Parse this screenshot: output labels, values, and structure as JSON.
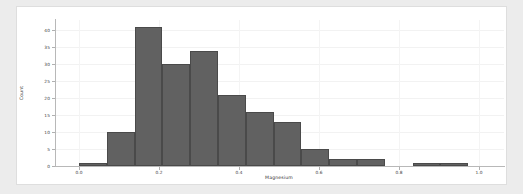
{
  "figure": {
    "background_color": "#ececec",
    "card_color": "#ffffff"
  },
  "chart_data": {
    "type": "bar",
    "chart_subtype": "histogram",
    "title": "",
    "xlabel": "Magnesium",
    "ylabel": "Count",
    "xlim": [
      -0.06,
      1.06
    ],
    "ylim": [
      0,
      43
    ],
    "xticks": [
      0.0,
      0.2,
      0.4,
      0.6,
      0.8,
      1.0
    ],
    "xtick_labels": [
      "0.0",
      "0.2",
      "0.4",
      "0.6",
      "0.8",
      "1.0"
    ],
    "yticks": [
      0,
      5,
      10,
      15,
      20,
      25,
      30,
      35,
      40
    ],
    "ytick_labels": [
      "0",
      "5",
      "10",
      "15",
      "20",
      "25",
      "30",
      "35",
      "40"
    ],
    "grid": false,
    "legend": null,
    "bar_color": "#616161",
    "bar_edge_color": "#4a4a4a",
    "bin_width": 0.0695,
    "bins": [
      {
        "left": 0.0,
        "right": 0.0695,
        "count": 1
      },
      {
        "left": 0.0695,
        "right": 0.139,
        "count": 10
      },
      {
        "left": 0.139,
        "right": 0.2085,
        "count": 41
      },
      {
        "left": 0.2085,
        "right": 0.278,
        "count": 30
      },
      {
        "left": 0.278,
        "right": 0.3475,
        "count": 34
      },
      {
        "left": 0.3475,
        "right": 0.417,
        "count": 21
      },
      {
        "left": 0.417,
        "right": 0.4865,
        "count": 16
      },
      {
        "left": 0.4865,
        "right": 0.556,
        "count": 13
      },
      {
        "left": 0.556,
        "right": 0.6255,
        "count": 5
      },
      {
        "left": 0.6255,
        "right": 0.695,
        "count": 2
      },
      {
        "left": 0.695,
        "right": 0.7645,
        "count": 2
      },
      {
        "left": 0.834,
        "right": 0.9035,
        "count": 1
      },
      {
        "left": 0.9035,
        "right": 0.973,
        "count": 1
      }
    ],
    "categories": [
      "0.03",
      "0.10",
      "0.17",
      "0.24",
      "0.31",
      "0.38",
      "0.45",
      "0.52",
      "0.59",
      "0.66",
      "0.73",
      "0.87",
      "0.94"
    ],
    "values": [
      1,
      10,
      41,
      30,
      34,
      21,
      16,
      13,
      5,
      2,
      2,
      1,
      1
    ]
  }
}
